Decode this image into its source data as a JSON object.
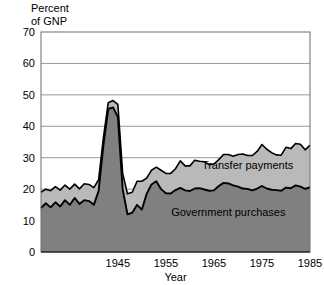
{
  "chart_data": {
    "type": "area",
    "stacked": true,
    "title": "",
    "ylabel": "Percent\nof GNP",
    "xlabel": "Year",
    "xlim": [
      1929,
      1985
    ],
    "ylim": [
      0,
      70
    ],
    "yticks": [
      0,
      10,
      20,
      30,
      40,
      50,
      60,
      70
    ],
    "xticks": [
      1945,
      1955,
      1965,
      1975,
      1985
    ],
    "grid": "horizontal",
    "legend": "inline-annotations",
    "colors": {
      "government_purchases": "#808080",
      "transfer_payments": "#b9b9b9",
      "line": "#000000",
      "gridline": "#9a9a9a",
      "frame": "#6e6e6e",
      "background": "#ffffff"
    },
    "annotations": [
      {
        "text": "Transfer payments",
        "x": 1972,
        "y": 26.5
      },
      {
        "text": "Government purchases",
        "x": 1968,
        "y": 11.5
      }
    ],
    "x": [
      1929,
      1930,
      1931,
      1932,
      1933,
      1934,
      1935,
      1936,
      1937,
      1938,
      1939,
      1940,
      1941,
      1942,
      1943,
      1944,
      1945,
      1946,
      1947,
      1948,
      1949,
      1950,
      1951,
      1952,
      1953,
      1954,
      1955,
      1956,
      1957,
      1958,
      1959,
      1960,
      1961,
      1962,
      1963,
      1964,
      1965,
      1966,
      1967,
      1968,
      1969,
      1970,
      1971,
      1972,
      1973,
      1974,
      1975,
      1976,
      1977,
      1978,
      1979,
      1980,
      1981,
      1982,
      1983,
      1984,
      1985
    ],
    "series": [
      {
        "name": "Government purchases",
        "values": [
          14.0,
          15.5,
          14.2,
          15.8,
          14.5,
          16.5,
          15.0,
          17.2,
          15.3,
          16.5,
          16.2,
          15.0,
          19.5,
          34.0,
          45.5,
          46.0,
          43.0,
          20.0,
          12.0,
          12.5,
          15.0,
          13.5,
          18.5,
          21.5,
          22.5,
          20.0,
          18.7,
          18.6,
          19.7,
          20.4,
          19.6,
          19.4,
          20.2,
          20.3,
          19.9,
          19.5,
          19.6,
          21.0,
          22.0,
          21.8,
          21.2,
          20.8,
          20.2,
          20.1,
          19.6,
          20.2,
          21.0,
          20.2,
          19.8,
          19.7,
          19.5,
          20.5,
          20.3,
          21.2,
          20.8,
          20.1,
          20.6
        ]
      },
      {
        "name": "Transfer payments",
        "values": [
          5.0,
          4.5,
          5.3,
          5.0,
          5.2,
          4.8,
          5.0,
          4.4,
          4.8,
          5.2,
          5.3,
          5.5,
          3.5,
          2.5,
          2.0,
          2.2,
          4.0,
          5.0,
          6.5,
          6.5,
          7.5,
          9.0,
          5.0,
          4.5,
          4.5,
          6.0,
          6.3,
          6.4,
          6.8,
          8.6,
          7.8,
          8.0,
          9.0,
          8.6,
          8.8,
          8.3,
          8.4,
          8.4,
          9.0,
          9.2,
          9.3,
          10.2,
          11.0,
          10.6,
          11.1,
          11.8,
          13.2,
          12.5,
          11.8,
          11.2,
          11.3,
          12.8,
          12.6,
          13.3,
          13.5,
          12.4,
          13.4
        ]
      }
    ],
    "total_values": [
      19.0,
      20.0,
      19.5,
      20.8,
      19.7,
      21.3,
      20.0,
      21.6,
      20.1,
      21.7,
      21.5,
      20.5,
      23.0,
      36.5,
      47.5,
      48.2,
      47.0,
      25.0,
      18.5,
      19.0,
      22.5,
      22.5,
      23.5,
      26.0,
      27.0,
      26.0,
      25.0,
      25.0,
      26.5,
      29.0,
      27.4,
      27.4,
      29.2,
      28.9,
      28.7,
      27.8,
      28.0,
      29.4,
      31.0,
      31.0,
      30.5,
      31.0,
      31.2,
      30.7,
      30.7,
      32.0,
      34.2,
      32.7,
      31.6,
      30.9,
      30.8,
      33.3,
      32.9,
      34.5,
      34.3,
      32.5,
      34.0
    ]
  }
}
